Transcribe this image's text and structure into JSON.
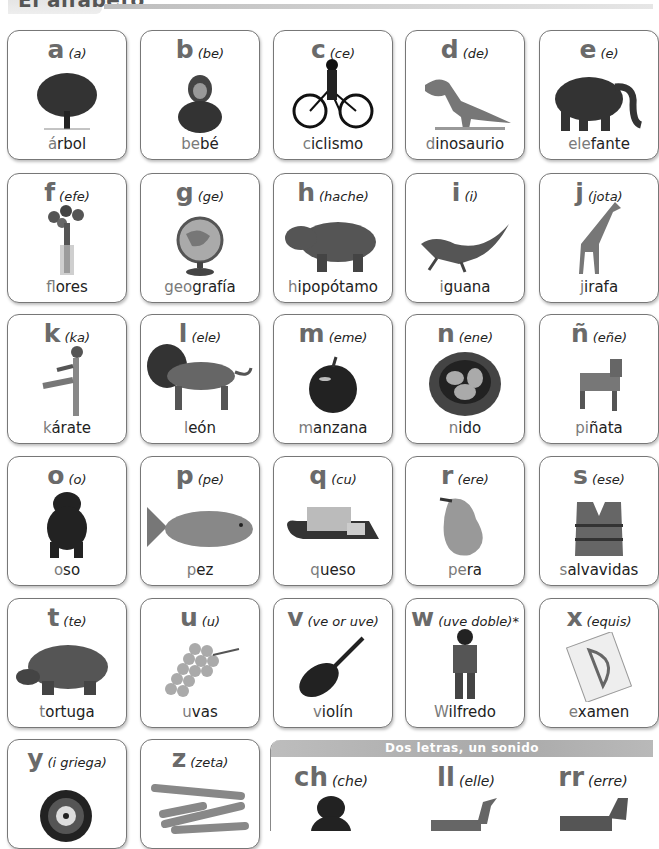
{
  "header": {
    "title": "El alfabeto"
  },
  "cards": [
    {
      "letter": "a",
      "name": "(a)",
      "word_hl": "á",
      "word_rest": "rbol",
      "icon": "tree-icon"
    },
    {
      "letter": "b",
      "name": "(be)",
      "word_hl": "be",
      "word_rest": "bé",
      "icon": "baby-icon"
    },
    {
      "letter": "c",
      "name": "(ce)",
      "word_hl": "c",
      "word_rest": "iclismo",
      "icon": "bicycle-icon"
    },
    {
      "letter": "d",
      "name": "(de)",
      "word_hl": "d",
      "word_rest": "inosaurio",
      "icon": "dinosaur-icon"
    },
    {
      "letter": "e",
      "name": "(e)",
      "word_hl": "ele",
      "word_rest": "fante",
      "icon": "elephant-icon"
    },
    {
      "letter": "f",
      "name": "(efe)",
      "word_hl": "f",
      "word_rest": "lores",
      "icon": "flowers-icon"
    },
    {
      "letter": "g",
      "name": "(ge)",
      "word_hl": "geo",
      "word_rest": "grafía",
      "icon": "globe-icon"
    },
    {
      "letter": "h",
      "name": "(hache)",
      "word_hl": "h",
      "word_rest": "ipopótamo",
      "icon": "hippo-icon"
    },
    {
      "letter": "i",
      "name": "(i)",
      "word_hl": "i",
      "word_rest": "guana",
      "icon": "iguana-icon"
    },
    {
      "letter": "j",
      "name": "(jota)",
      "word_hl": "j",
      "word_rest": "irafa",
      "icon": "giraffe-icon"
    },
    {
      "letter": "k",
      "name": "(ka)",
      "word_hl": "k",
      "word_rest": "árate",
      "icon": "karate-icon"
    },
    {
      "letter": "l",
      "name": "(ele)",
      "word_hl": "l",
      "word_rest": "eón",
      "icon": "lion-icon"
    },
    {
      "letter": "m",
      "name": "(eme)",
      "word_hl": "m",
      "word_rest": "anzana",
      "icon": "apple-icon"
    },
    {
      "letter": "n",
      "name": "(ene)",
      "word_hl": "n",
      "word_rest": "ido",
      "icon": "nest-icon"
    },
    {
      "letter": "ñ",
      "name": "(eñe)",
      "word_hl": "pi",
      "word_rest": "ñata",
      "icon": "pinata-icon"
    },
    {
      "letter": "o",
      "name": "(o)",
      "word_hl": "o",
      "word_rest": "so",
      "icon": "bear-icon"
    },
    {
      "letter": "p",
      "name": "(pe)",
      "word_hl": "p",
      "word_rest": "ez",
      "icon": "fish-icon"
    },
    {
      "letter": "q",
      "name": "(cu)",
      "word_hl": "q",
      "word_rest": "ueso",
      "icon": "cheese-icon"
    },
    {
      "letter": "r",
      "name": "(ere)",
      "word_hl": "pe",
      "word_rest": "ra",
      "icon": "pear-icon"
    },
    {
      "letter": "s",
      "name": "(ese)",
      "word_hl": "s",
      "word_rest": "alvavidas",
      "icon": "life-vest-icon"
    },
    {
      "letter": "t",
      "name": "(te)",
      "word_hl": "t",
      "word_rest": "ortuga",
      "icon": "tortoise-icon"
    },
    {
      "letter": "u",
      "name": "(u)",
      "word_hl": "u",
      "word_rest": "vas",
      "icon": "grapes-icon"
    },
    {
      "letter": "v",
      "name": "(ve or uve)",
      "word_hl": "v",
      "word_rest": "iolín",
      "icon": "violin-icon"
    },
    {
      "letter": "w",
      "name": "(uve doble)*",
      "word_hl": "W",
      "word_rest": "ilfredo",
      "icon": "boy-icon"
    },
    {
      "letter": "x",
      "name": "(equis)",
      "word_hl": "e",
      "word_rest": "xamen",
      "icon": "exam-icon"
    },
    {
      "letter": "y",
      "name": "(i griega)",
      "word_hl": "",
      "word_rest": "",
      "icon": "yoyo-icon"
    },
    {
      "letter": "z",
      "name": "(zeta)",
      "word_hl": "",
      "word_rest": "",
      "icon": "carrots-icon"
    }
  ],
  "digraphs": {
    "title": "Dos letras, un sonido",
    "items": [
      {
        "letter": "ch",
        "name": "(che)",
        "icon": "chimpanzee-icon"
      },
      {
        "letter": "ll",
        "name": "(elle)",
        "icon": "llama-icon"
      },
      {
        "letter": "rr",
        "name": "(erre)",
        "icon": "donkey-icon"
      }
    ]
  }
}
